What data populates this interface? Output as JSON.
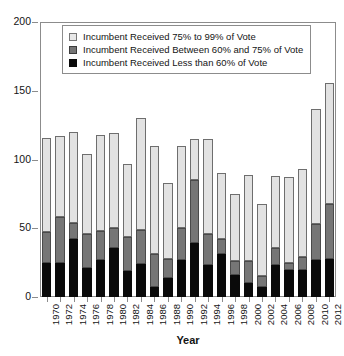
{
  "chart_data": {
    "type": "bar",
    "title": "",
    "subtitle": "",
    "xlabel": "Year",
    "ylabel": "",
    "stacked": true,
    "grid": false,
    "legend_position": "top-left inside plot",
    "ylim": [
      0,
      200
    ],
    "y_ticks": [
      0,
      50,
      100,
      150,
      200
    ],
    "y_tick_labels": [
      "0",
      "50",
      "100",
      "150",
      "200"
    ],
    "categories": [
      "1970",
      "1972",
      "1974",
      "1976",
      "1978",
      "1980",
      "1982",
      "1984",
      "1986",
      "1988",
      "1990",
      "1992",
      "1994",
      "1996",
      "1998",
      "2000",
      "2002",
      "2004",
      "2006",
      "2008",
      "2010",
      "2012"
    ],
    "series": [
      {
        "name": "Incumbent Received Less than 60% of Vote",
        "color": "#0a0a0a",
        "values": [
          25,
          25,
          42,
          21,
          27,
          36,
          19,
          24,
          7,
          14,
          27,
          39,
          23,
          31,
          16,
          10,
          7,
          23,
          20,
          20,
          27,
          28
        ]
      },
      {
        "name": "Incumbent Received Between 60% and 75% of Vote",
        "color": "#767676",
        "values": [
          22,
          33,
          12,
          25,
          21,
          14,
          25,
          25,
          24,
          14,
          23,
          46,
          23,
          11,
          10,
          16,
          8,
          13,
          5,
          9,
          26,
          40
        ]
      },
      {
        "name": "Incumbent Received 75% to 99% of Vote",
        "color": "#e2e2e2",
        "values": [
          69,
          59,
          66,
          58,
          70,
          69,
          53,
          81,
          79,
          55,
          60,
          30,
          69,
          48,
          49,
          63,
          53,
          52,
          62,
          64,
          84,
          88
        ]
      }
    ],
    "totals": [
      116,
      117,
      120,
      104,
      118,
      119,
      97,
      130,
      110,
      83,
      110,
      115,
      115,
      90,
      75,
      89,
      68,
      88,
      87,
      93,
      137,
      156
    ]
  },
  "legend": {
    "items": [
      {
        "label": "Incumbent Received 75% to 99% of Vote",
        "swatch": "light-gray-square-icon"
      },
      {
        "label": "Incumbent Received Between 60% and 75% of Vote",
        "swatch": "dark-gray-square-icon"
      },
      {
        "label": "Incumbent Received Less than 60% of Vote",
        "swatch": "black-square-icon"
      }
    ]
  },
  "axes": {
    "x_title": "Year"
  }
}
